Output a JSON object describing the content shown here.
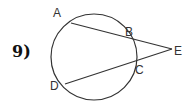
{
  "problem": {
    "number": "9)"
  },
  "diagram": {
    "circle": {
      "cx": 94,
      "cy": 57,
      "r": 43
    },
    "points": {
      "A": {
        "label": "A",
        "x": 71,
        "y": 23,
        "lx": 53,
        "ly": 7
      },
      "B": {
        "label": "B",
        "x": 129,
        "y": 37,
        "lx": 125,
        "ly": 27
      },
      "C": {
        "label": "C",
        "x": 133,
        "y": 63,
        "lx": 135,
        "ly": 64
      },
      "D": {
        "label": "D",
        "x": 65,
        "y": 84,
        "lx": 50,
        "ly": 80
      },
      "E": {
        "label": "E",
        "x": 172,
        "y": 49,
        "lx": 174,
        "ly": 45
      }
    },
    "segments": [
      [
        "A",
        "E"
      ],
      [
        "D",
        "E"
      ]
    ],
    "stroke_color": "#333333"
  }
}
